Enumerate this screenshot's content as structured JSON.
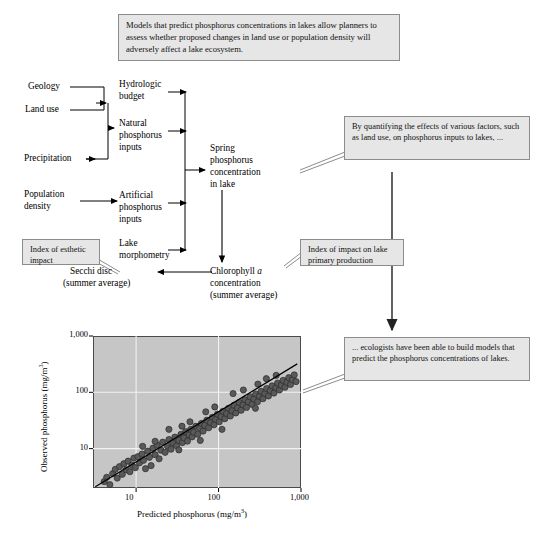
{
  "figure": {
    "title_box": {
      "text": "Models that predict phosphorus concentrations in lakes allow planners to assess whether proposed changes in land use or population density will adversely affect a lake ecosystem."
    },
    "flow_labels": {
      "geology": "Geology",
      "land_use": "Land use",
      "precipitation": "Precipitation",
      "population_density_l1": "Population",
      "population_density_l2": "density",
      "hydrologic_budget_l1": "Hydrologic",
      "hydrologic_budget_l2": "budget",
      "natural_inputs_l1": "Natural",
      "natural_inputs_l2": "phosphorus",
      "natural_inputs_l3": "inputs",
      "artificial_inputs_l1": "Artificial",
      "artificial_inputs_l2": "phosphorus",
      "artificial_inputs_l3": "inputs",
      "lake_morphometry_l1": "Lake",
      "lake_morphometry_l2": "morphometry",
      "spring_p_l1": "Spring",
      "spring_p_l2": "phosphorus",
      "spring_p_l3": "concentration",
      "spring_p_l4": "in lake",
      "chlorophyll_l1_pre": "Chlorophyll ",
      "chlorophyll_l1_italic": "a",
      "chlorophyll_l2": "concentration",
      "chlorophyll_l3": "(summer average)",
      "secchi_l1": "Secchi disc",
      "secchi_l2": "(summer average)"
    },
    "annotations": {
      "esthetic": "Index of esthetic impact",
      "primary_production": "Index of impact on lake primary production",
      "quantifying": "By quantifying the effects of various factors, such as land use, on phosphorus inputs to lakes, ...",
      "ecologists": "... ecologists have been able to build models that predict the phosphorus concentrations of lakes."
    },
    "colors": {
      "box_fill": "#e6e6e6",
      "box_border": "#8c8c8c",
      "plot_fill": "#c6c6c6",
      "plot_border": "#4a4a4a",
      "point_fill": "#595959",
      "point_stroke": "#2b2b2b",
      "gridline": "#f2f2f2",
      "trendline": "#000000"
    }
  },
  "chart_data": {
    "type": "scatter",
    "title": "",
    "xlabel": "Predicted phosphorus (mg/m3)",
    "xlabel_base": "Predicted phosphorus (mg/m",
    "xlabel_sup": "3",
    "xlabel_tail": ")",
    "ylabel_base": "Observed phosphorus (mg/m",
    "ylabel_sup": "3",
    "ylabel_tail": ")",
    "xscale": "log",
    "yscale": "log",
    "xlim": [
      3,
      1000
    ],
    "ylim": [
      2,
      1000
    ],
    "xticks": [
      10,
      100,
      1000
    ],
    "xticklabels": [
      "10",
      "100",
      "1,000"
    ],
    "yticks": [
      10,
      100,
      1000
    ],
    "yticklabels": [
      "10",
      "100",
      "1,000"
    ],
    "grid": true,
    "legend": "none",
    "trendline": {
      "x": [
        3.2,
        900
      ],
      "y": [
        2.1,
        320
      ]
    },
    "points": [
      [
        4.1,
        2.6
      ],
      [
        4.4,
        3.1
      ],
      [
        4.8,
        2.3
      ],
      [
        5.2,
        3.6
      ],
      [
        5.6,
        4.3
      ],
      [
        5.9,
        3.0
      ],
      [
        6.3,
        4.8
      ],
      [
        6.8,
        3.5
      ],
      [
        7.1,
        5.4
      ],
      [
        7.6,
        4.2
      ],
      [
        8.0,
        6.0
      ],
      [
        8.4,
        3.9
      ],
      [
        8.9,
        5.1
      ],
      [
        9.4,
        6.8
      ],
      [
        9.8,
        4.6
      ],
      [
        10.5,
        7.2
      ],
      [
        11.0,
        5.6
      ],
      [
        11.8,
        8.0
      ],
      [
        12.3,
        6.2
      ],
      [
        13.0,
        4.4
      ],
      [
        13.8,
        9.0
      ],
      [
        14.5,
        7.0
      ],
      [
        15.2,
        5.0
      ],
      [
        16.0,
        10.2
      ],
      [
        17.0,
        7.8
      ],
      [
        18.0,
        11.5
      ],
      [
        19.0,
        6.6
      ],
      [
        20.0,
        9.4
      ],
      [
        21.0,
        13.0
      ],
      [
        22.5,
        8.6
      ],
      [
        24.0,
        11.0
      ],
      [
        25.0,
        14.5
      ],
      [
        26.5,
        9.8
      ],
      [
        28.0,
        12.5
      ],
      [
        29.5,
        16.0
      ],
      [
        31.0,
        11.2
      ],
      [
        33.0,
        14.0
      ],
      [
        35.0,
        18.0
      ],
      [
        36.5,
        12.8
      ],
      [
        38.0,
        15.5
      ],
      [
        40.0,
        20.0
      ],
      [
        42.0,
        13.6
      ],
      [
        44.0,
        17.5
      ],
      [
        46.0,
        22.0
      ],
      [
        48.0,
        16.2
      ],
      [
        50.0,
        19.5
      ],
      [
        53.0,
        25.0
      ],
      [
        56.0,
        18.0
      ],
      [
        59.0,
        23.0
      ],
      [
        62.0,
        28.0
      ],
      [
        65.0,
        20.5
      ],
      [
        68.0,
        26.0
      ],
      [
        72.0,
        32.0
      ],
      [
        76.0,
        23.5
      ],
      [
        80.0,
        29.0
      ],
      [
        84.0,
        36.0
      ],
      [
        88.0,
        26.5
      ],
      [
        92.0,
        33.0
      ],
      [
        97.0,
        41.0
      ],
      [
        102.0,
        30.0
      ],
      [
        107.0,
        37.0
      ],
      [
        113.0,
        46.0
      ],
      [
        119.0,
        34.0
      ],
      [
        125.0,
        42.0
      ],
      [
        132.0,
        52.0
      ],
      [
        139.0,
        38.0
      ],
      [
        146.0,
        47.0
      ],
      [
        154.0,
        59.0
      ],
      [
        162.0,
        43.0
      ],
      [
        170.0,
        53.0
      ],
      [
        179.0,
        66.0
      ],
      [
        188.0,
        48.0
      ],
      [
        198.0,
        60.0
      ],
      [
        208.0,
        74.0
      ],
      [
        219.0,
        54.0
      ],
      [
        230.0,
        68.0
      ],
      [
        242.0,
        83.0
      ],
      [
        255.0,
        61.0
      ],
      [
        268.0,
        76.0
      ],
      [
        282.0,
        93.0
      ],
      [
        297.0,
        68.0
      ],
      [
        312.0,
        85.0
      ],
      [
        329.0,
        104.0
      ],
      [
        346.0,
        77.0
      ],
      [
        364.0,
        95.0
      ],
      [
        383.0,
        117.0
      ],
      [
        403.0,
        86.0
      ],
      [
        424.0,
        107.0
      ],
      [
        446.0,
        130.0
      ],
      [
        470.0,
        97.0
      ],
      [
        495.0,
        120.0
      ],
      [
        520.0,
        146.0
      ],
      [
        548.0,
        110.0
      ],
      [
        577.0,
        134.0
      ],
      [
        607.0,
        163.0
      ],
      [
        640.0,
        123.0
      ],
      [
        674.0,
        150.0
      ],
      [
        710.0,
        182.0
      ],
      [
        747.0,
        138.0
      ],
      [
        787.0,
        168.0
      ],
      [
        828.0,
        204.0
      ],
      [
        872.0,
        155.0
      ],
      [
        60.0,
        14.0
      ],
      [
        70.0,
        45.0
      ],
      [
        25.0,
        22.0
      ],
      [
        17.0,
        13.5
      ],
      [
        12.0,
        11.0
      ],
      [
        33.0,
        9.5
      ],
      [
        150.0,
        95.0
      ],
      [
        200.0,
        110.0
      ],
      [
        280.0,
        52.0
      ],
      [
        380.0,
        175.0
      ],
      [
        500.0,
        200.0
      ],
      [
        90.0,
        55.0
      ],
      [
        110.0,
        22.0
      ],
      [
        45.0,
        30.0
      ],
      [
        36.0,
        25.0
      ],
      [
        300.0,
        140.0
      ]
    ]
  }
}
